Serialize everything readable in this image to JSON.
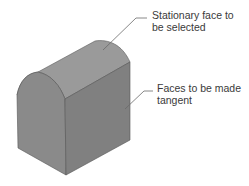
{
  "figure": {
    "callouts": [
      {
        "line1": "Stationary face to",
        "line2": "be selected"
      },
      {
        "line1": "Faces to be made",
        "line2": "tangent"
      }
    ],
    "colors": {
      "top_face": "#9a9a9a",
      "left_face": "#8a8a8a",
      "right_face": "#7f7f7f",
      "edge": "#555555",
      "leader": "#6a6a6a"
    }
  }
}
